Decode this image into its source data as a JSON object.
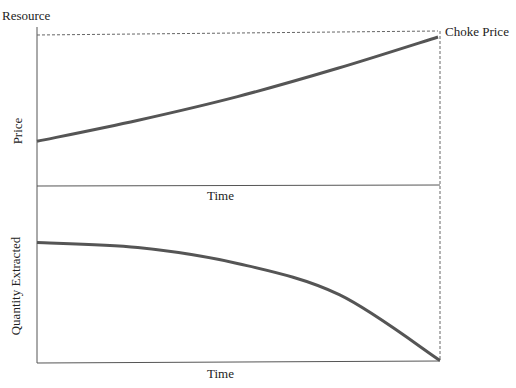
{
  "chart_data": [
    {
      "type": "line",
      "title": "Resource",
      "xlabel": "Time",
      "ylabel": "Price",
      "annotations": [
        "Choke Price"
      ],
      "series": [
        {
          "name": "Price path",
          "x": [
            0,
            0.25,
            0.5,
            0.75,
            1.0
          ],
          "y": [
            0.3,
            0.44,
            0.6,
            0.79,
            1.0
          ]
        }
      ],
      "reference_lines": [
        {
          "type": "horizontal-dashed",
          "y": 1.0,
          "label": "Choke Price"
        },
        {
          "type": "vertical-dashed",
          "x": 1.0
        }
      ],
      "xlim": [
        0,
        1
      ],
      "ylim": [
        0,
        1.02
      ],
      "grid": false
    },
    {
      "type": "line",
      "title": "",
      "xlabel": "Time",
      "ylabel": "Quantity Extracted",
      "series": [
        {
          "name": "Extraction path",
          "x": [
            0,
            0.25,
            0.5,
            0.75,
            1.0
          ],
          "y": [
            0.97,
            0.93,
            0.8,
            0.55,
            0.02
          ]
        }
      ],
      "xlim": [
        0,
        1
      ],
      "ylim": [
        0,
        1.2
      ],
      "grid": false
    }
  ],
  "labels": {
    "resource": "Resource",
    "choke_price": "Choke Price",
    "price": "Price",
    "time_top": "Time",
    "quantity": "Quantity Extracted",
    "time_bottom": "Time"
  }
}
